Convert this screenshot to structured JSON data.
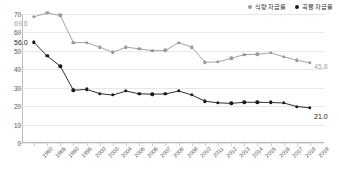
{
  "legend": {
    "position": "top-right",
    "items": [
      {
        "name": "식량 자급률",
        "color": "#9a9a9a",
        "marker": "legend-dot-food"
      },
      {
        "name": "곡물 자급률",
        "color": "#1a1a1a",
        "marker": "legend-dot-grain"
      }
    ]
  },
  "chart_data": {
    "type": "line",
    "title": "",
    "xlabel": "",
    "ylabel": "",
    "ylim": [
      0,
      70
    ],
    "ytick_step": 10,
    "yticks": [
      "0",
      "10",
      "20",
      "30",
      "40",
      "50",
      "60",
      "70"
    ],
    "grid": true,
    "legend_position": "top-right",
    "categories": [
      "1980",
      "1985",
      "1990",
      "1995",
      "2000",
      "2003",
      "2004",
      "2005",
      "2006",
      "2007",
      "2008",
      "2009",
      "2010",
      "2011",
      "2012",
      "2013",
      "2014",
      "2015",
      "2016",
      "2017",
      "2018",
      "2019"
    ],
    "series": [
      {
        "name": "식량 자급률",
        "color": "#9a9a9a",
        "values": [
          68.5,
          70.5,
          69.2,
          54.5,
          54.5,
          52.0,
          49.2,
          52.0,
          51.1,
          50.1,
          50.2,
          54.5,
          52.0,
          43.8,
          44.0,
          45.9,
          48.0,
          48.1,
          48.9,
          46.8,
          44.9,
          43.5
        ]
      },
      {
        "name": "곡물 자급률",
        "color": "#1a1a1a",
        "values": [
          54.6,
          47.2,
          41.7,
          28.6,
          29.1,
          26.8,
          26.0,
          28.2,
          26.7,
          26.5,
          26.6,
          28.2,
          26.1,
          22.7,
          21.8,
          21.5,
          22.1,
          22.1,
          22.0,
          21.7,
          19.8,
          19.1
        ]
      }
    ],
    "annotations": [
      {
        "text": "69.6",
        "series": "식량 자급률",
        "anchor_index": 0,
        "color": "#a5a5a5"
      },
      {
        "text": "56.0",
        "series": "곡물 자급률",
        "anchor_index": 0,
        "color": "#222222"
      },
      {
        "text": "45.8",
        "series": "식량 자급률",
        "anchor_index": 21,
        "color": "#a5a5a5"
      },
      {
        "text": "21.0",
        "series": "곡물 자급률",
        "anchor_index": 21,
        "color": "#222222"
      }
    ]
  }
}
